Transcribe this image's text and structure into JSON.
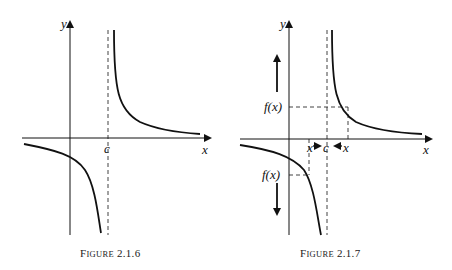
{
  "figures": [
    {
      "id": "fig1",
      "caption": {
        "first": "F",
        "rest": "IGURE",
        "num": "2.1.6"
      },
      "axis_labels": {
        "x": "x",
        "y": "y"
      },
      "asymptote_label": "c"
    },
    {
      "id": "fig2",
      "caption": {
        "first": "F",
        "rest": "IGURE",
        "num": "2.1.7"
      },
      "axis_labels": {
        "x": "x",
        "y": "y"
      },
      "asymptote_label": "c",
      "fx_upper": "f(x)",
      "fx_lower": "f(x)",
      "x_left": "x",
      "x_right": "x"
    }
  ],
  "colors": {
    "ink": "#111111",
    "background": "#ffffff"
  }
}
